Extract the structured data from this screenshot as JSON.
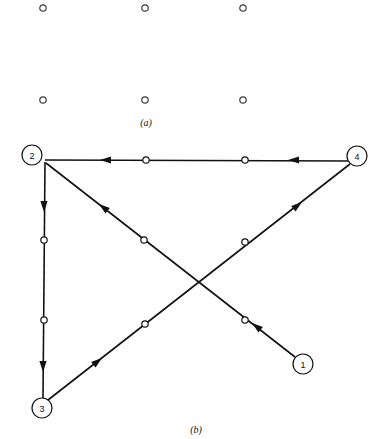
{
  "figure": {
    "panels": [
      {
        "id": "panel-a",
        "caption": "(a)",
        "caption_x": 146,
        "caption_y": 126,
        "description": "six isolated nodes arranged in two rows of three",
        "dots": [
          {
            "name": "grid-dot-top-left",
            "cx": 43,
            "cy": 8,
            "r": 3.2
          },
          {
            "name": "grid-dot-top-center",
            "cx": 145,
            "cy": 8,
            "r": 3.2
          },
          {
            "name": "grid-dot-top-right",
            "cx": 243,
            "cy": 8,
            "r": 3.2
          },
          {
            "name": "grid-dot-bottom-left",
            "cx": 43,
            "cy": 100,
            "r": 3.2
          },
          {
            "name": "grid-dot-bottom-center",
            "cx": 145,
            "cy": 100,
            "r": 3.2
          },
          {
            "name": "grid-dot-bottom-right",
            "cx": 243,
            "cy": 100,
            "r": 3.2
          }
        ]
      },
      {
        "id": "panel-b",
        "caption": "(b)",
        "caption_x": 196,
        "caption_y": 433,
        "description": "directed graph with four labelled nodes and four arrowed edges"
      }
    ],
    "nodes": [
      {
        "name": "node-1",
        "label": "1",
        "cx": 303,
        "cy": 364,
        "r": 10
      },
      {
        "name": "node-2",
        "label": "2",
        "cx": 32,
        "cy": 155,
        "r": 10
      },
      {
        "name": "node-3",
        "label": "3",
        "cx": 42,
        "cy": 408,
        "r": 10
      },
      {
        "name": "node-4",
        "label": "4",
        "cx": 357,
        "cy": 156,
        "r": 10
      }
    ],
    "edges": [
      {
        "name": "edge-4-to-2",
        "from": "4",
        "to": "2",
        "x1": 348,
        "y1": 161,
        "x2": 45,
        "y2": 160,
        "arrows": [
          {
            "x": 100,
            "y": 160,
            "angle": 180
          },
          {
            "x": 288,
            "y": 160,
            "angle": 180
          }
        ],
        "dots": [
          {
            "cx": 146,
            "cy": 160,
            "r": 3.2
          },
          {
            "cx": 245,
            "cy": 160,
            "r": 3.2
          }
        ]
      },
      {
        "name": "edge-2-to-3",
        "from": "2",
        "to": "3",
        "x1": 45,
        "y1": 162,
        "x2": 43,
        "y2": 398,
        "arrows": [
          {
            "x": 44,
            "y": 212,
            "angle": 90
          },
          {
            "x": 43,
            "y": 372,
            "angle": 90
          }
        ],
        "dots": [
          {
            "cx": 44,
            "cy": 240,
            "r": 3.2
          },
          {
            "cx": 44,
            "cy": 320,
            "r": 3.2
          }
        ]
      },
      {
        "name": "edge-1-to-2",
        "from": "1",
        "to": "2",
        "x1": 295,
        "y1": 357,
        "x2": 46,
        "y2": 163,
        "arrows": [
          {
            "x": 99,
            "y": 204,
            "angle": 218
          },
          {
            "x": 252,
            "y": 323,
            "angle": 218
          }
        ],
        "dots": [
          {
            "cx": 144,
            "cy": 240,
            "r": 3.2
          },
          {
            "cx": 245,
            "cy": 320,
            "r": 3.2
          }
        ]
      },
      {
        "name": "edge-3-to-4",
        "from": "3",
        "to": "4",
        "x1": 48,
        "y1": 400,
        "x2": 350,
        "y2": 164,
        "arrows": [
          {
            "x": 102,
            "y": 358,
            "angle": -38
          },
          {
            "x": 302,
            "y": 202,
            "angle": -38
          }
        ],
        "dots": [
          {
            "cx": 145,
            "cy": 324,
            "r": 3.2
          },
          {
            "cx": 245,
            "cy": 242,
            "r": 3.2
          }
        ]
      }
    ],
    "colors": {
      "ink": "#111111",
      "paper": "#ffffff",
      "grid_dot_stroke": "#3a3a3a"
    }
  }
}
